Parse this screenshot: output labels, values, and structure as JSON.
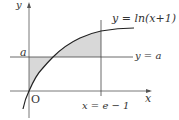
{
  "diagram": {
    "curve_label": "y = ln(x+1)",
    "line_label": "y = a",
    "vline_label": "x = e − 1",
    "y_axis_label": "y",
    "x_axis_label": "x",
    "origin_label": "O",
    "a_label": "a"
  },
  "colors": {
    "shade": "#d8d8d8",
    "line": "#444444",
    "curve": "#222222"
  }
}
